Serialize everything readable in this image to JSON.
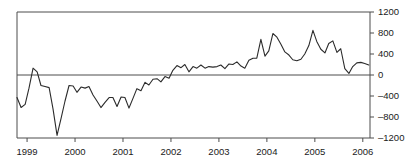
{
  "chart_data": {
    "type": "line",
    "title": "",
    "subtitle": "",
    "xlabel": "",
    "ylabel": "",
    "xlim": [
      1998.79,
      2006.15
    ],
    "ylim": [
      -1200,
      1200
    ],
    "grid": false,
    "legend": false,
    "legend_position": "none",
    "zero_line": true,
    "axis_style": {
      "left_spine": true,
      "top_spine": true,
      "right_spine": true,
      "bottom_spine": true,
      "y_ticks_side": "right",
      "x_ticks_side": "bottom"
    },
    "yticks": [
      -1200,
      -800,
      -400,
      0,
      400,
      800,
      1200
    ],
    "ytick_labels": [
      "–1200",
      "–800",
      "–400",
      "0",
      "400",
      "800",
      "1200"
    ],
    "xticks": [
      1999,
      2000,
      2001,
      2002,
      2003,
      2004,
      2005,
      2006
    ],
    "xtick_labels": [
      "1999",
      "2000",
      "2001",
      "2002",
      "2003",
      "2004",
      "2005",
      "2006"
    ],
    "series": [
      {
        "name": "series-1",
        "color": "#2b2b2b",
        "line_width": 1.1,
        "x": [
          1998.79,
          1998.875,
          1998.96,
          1999.04,
          1999.125,
          1999.21,
          1999.29,
          1999.375,
          1999.46,
          1999.54,
          1999.625,
          1999.71,
          1999.79,
          1999.875,
          1999.96,
          2000.04,
          2000.125,
          2000.21,
          2000.29,
          2000.375,
          2000.46,
          2000.54,
          2000.625,
          2000.71,
          2000.79,
          2000.875,
          2000.96,
          2001.04,
          2001.125,
          2001.21,
          2001.29,
          2001.375,
          2001.46,
          2001.54,
          2001.625,
          2001.71,
          2001.79,
          2001.875,
          2001.96,
          2002.04,
          2002.125,
          2002.21,
          2002.29,
          2002.375,
          2002.46,
          2002.54,
          2002.625,
          2002.71,
          2002.79,
          2002.875,
          2002.96,
          2003.04,
          2003.125,
          2003.21,
          2003.29,
          2003.375,
          2003.46,
          2003.54,
          2003.625,
          2003.71,
          2003.79,
          2003.875,
          2003.96,
          2004.04,
          2004.125,
          2004.21,
          2004.29,
          2004.375,
          2004.46,
          2004.54,
          2004.625,
          2004.71,
          2004.79,
          2004.875,
          2004.96,
          2005.04,
          2005.125,
          2005.21,
          2005.29,
          2005.375,
          2005.46,
          2005.54,
          2005.625,
          2005.71,
          2005.79,
          2005.875,
          2005.96,
          2006.04,
          2006.125
        ],
        "values": [
          -430,
          -620,
          -560,
          -250,
          130,
          60,
          -200,
          -220,
          -240,
          -640,
          -1150,
          -820,
          -500,
          -200,
          -210,
          -330,
          -230,
          -250,
          -220,
          -380,
          -500,
          -620,
          -520,
          -430,
          -430,
          -600,
          -420,
          -430,
          -630,
          -440,
          -260,
          -300,
          -140,
          -190,
          -80,
          -70,
          -130,
          -30,
          -60,
          90,
          180,
          140,
          200,
          60,
          160,
          130,
          190,
          130,
          160,
          150,
          160,
          190,
          120,
          210,
          200,
          250,
          170,
          130,
          280,
          320,
          320,
          680,
          360,
          460,
          790,
          720,
          590,
          440,
          380,
          290,
          270,
          300,
          400,
          560,
          850,
          640,
          490,
          420,
          600,
          650,
          430,
          500,
          120,
          30,
          160,
          230,
          240,
          220,
          190
        ]
      }
    ]
  }
}
